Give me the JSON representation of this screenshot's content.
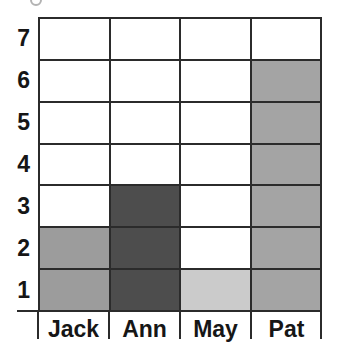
{
  "chart_data": {
    "type": "bar",
    "style": "block-grid-pictograph",
    "title": "",
    "xlabel": "",
    "ylabel": "",
    "categories": [
      "Jack",
      "Ann",
      "May",
      "Pat"
    ],
    "values": [
      2,
      3,
      1,
      6
    ],
    "series": [
      {
        "name": "Jack",
        "value": 2,
        "color": "#9c9c9c"
      },
      {
        "name": "Ann",
        "value": 3,
        "color": "#4d4d4d"
      },
      {
        "name": "May",
        "value": 1,
        "color": "#cbcbcb"
      },
      {
        "name": "Pat",
        "value": 6,
        "color": "#a4a4a4"
      }
    ],
    "y_ticks": [
      "7",
      "6",
      "5",
      "4",
      "3",
      "2",
      "1"
    ],
    "ylim": [
      0,
      7
    ],
    "rows": 7,
    "columns": 4,
    "grid": true,
    "grid_line_color": "#2b2b2b",
    "empty_cell_color": "#ffffff",
    "text_color": "#161616",
    "legend": "none"
  }
}
